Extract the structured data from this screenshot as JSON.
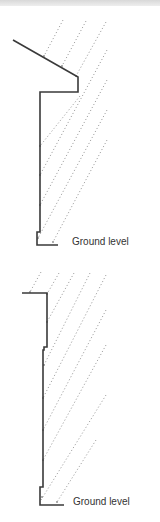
{
  "figure": {
    "top_bar_color": "#e2e2e2",
    "diagrams": [
      {
        "name": "pitched-roof-overhang",
        "ground_label": "Ground level"
      },
      {
        "name": "flat-roof-parapet",
        "ground_label": "Ground level"
      }
    ],
    "colors": {
      "wall_line": "#3a3a3a",
      "rain_line": "#9a9a9a",
      "label_text": "#333333"
    }
  }
}
